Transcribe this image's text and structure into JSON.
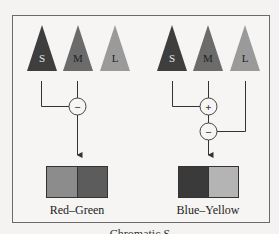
{
  "diagram": {
    "caption": "Chromatic S",
    "colors": {
      "background": "#f4f3f1",
      "frame": "#6a6a6a",
      "line": "#333333",
      "s_cone": "#3e3e3e",
      "m_cone": "#6b6b6b",
      "l_cone": "#9a9a9a"
    },
    "channels": [
      {
        "id": "red-green",
        "label": "Red–Green",
        "cones": [
          {
            "id": "S",
            "label": "S"
          },
          {
            "id": "M",
            "label": "M"
          },
          {
            "id": "L",
            "label": "L"
          }
        ],
        "operators": [
          {
            "sign": "−",
            "inputs": [
              "S",
              "M"
            ]
          }
        ],
        "swatch": [
          "#8c8c8c",
          "#5c5c5c"
        ]
      },
      {
        "id": "blue-yellow",
        "label": "Blue–Yellow",
        "cones": [
          {
            "id": "S",
            "label": "S"
          },
          {
            "id": "M",
            "label": "M"
          },
          {
            "id": "L",
            "label": "L"
          }
        ],
        "operators": [
          {
            "sign": "+",
            "inputs": [
              "S",
              "M"
            ]
          },
          {
            "sign": "−",
            "inputs": [
              "+",
              "L"
            ]
          }
        ],
        "swatch": [
          "#3a3a3a",
          "#b4b4b4"
        ]
      }
    ]
  }
}
